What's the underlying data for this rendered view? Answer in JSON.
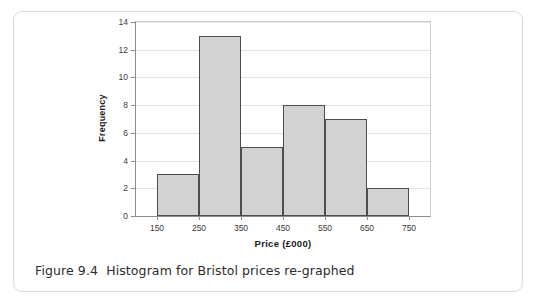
{
  "figure": {
    "caption": "Figure 9.4  Histogram for Bristol prices re-graphed"
  },
  "colors": {
    "bar_fill": "#d2d2d2",
    "bar_stroke": "#4d4d4d",
    "axis": "#8c8c8c",
    "gridline": "#e3e3e3",
    "card_border": "#d9d9d9",
    "text": "#1a1a1a"
  },
  "chart_data": {
    "type": "bar",
    "title": "",
    "subtitle": "",
    "xlabel": "Price (£000)",
    "ylabel": "Frequency",
    "categories": [
      "150–250",
      "250–350",
      "350–450",
      "450–550",
      "550–650",
      "650–750"
    ],
    "bin_edges": [
      150,
      250,
      350,
      450,
      550,
      650,
      750
    ],
    "values": [
      3,
      13,
      5,
      8,
      7,
      2
    ],
    "xlim": [
      100,
      800
    ],
    "ylim": [
      0,
      14
    ],
    "xticks": [
      150,
      250,
      350,
      450,
      550,
      650,
      750
    ],
    "yticks": [
      0,
      2,
      4,
      6,
      8,
      10,
      12,
      14
    ],
    "xtick_labels": [
      "150",
      "250",
      "350",
      "450",
      "550",
      "650",
      "750"
    ],
    "ytick_labels": [
      "0",
      "2",
      "4",
      "6",
      "8",
      "10",
      "12",
      "14"
    ],
    "grid": "horizontal",
    "legend": "none"
  }
}
